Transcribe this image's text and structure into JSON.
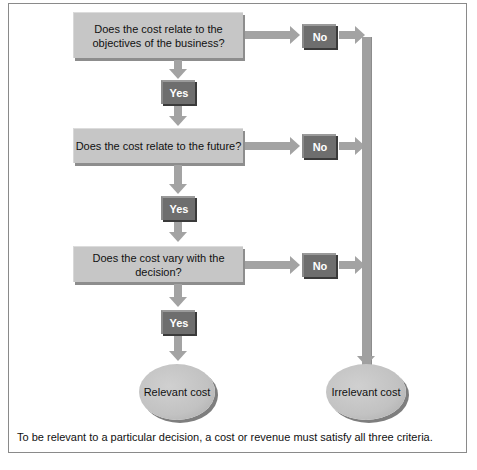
{
  "diagram": {
    "questions": [
      {
        "label": "Does the cost relate to the objectives of the business?"
      },
      {
        "label": "Does the cost relate to the future?"
      },
      {
        "label": "Does the cost vary with the decision?"
      }
    ],
    "yes_label": "Yes",
    "no_label": "No",
    "outcomes": {
      "relevant": "Relevant cost",
      "irrelevant": "Irrelevant cost"
    },
    "caption": "To be relevant to a particular decision, a cost or revenue must satisfy all three criteria."
  }
}
